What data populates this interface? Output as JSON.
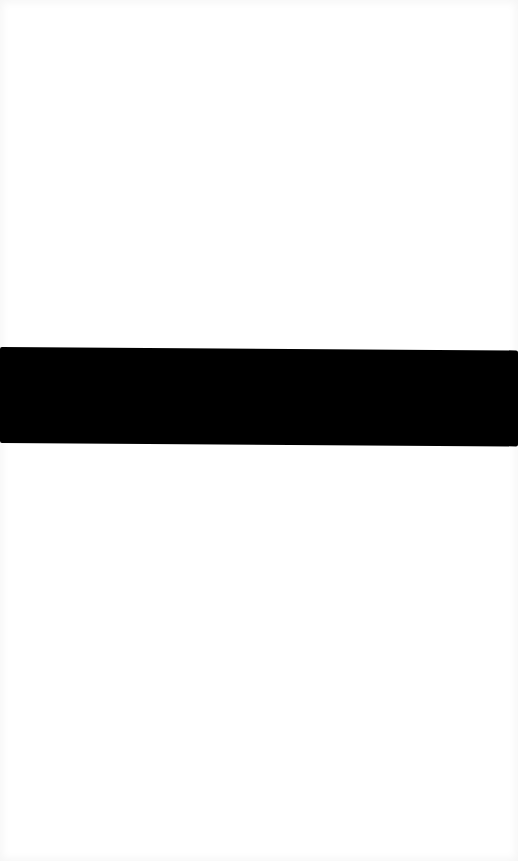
{
  "screen": {
    "width": 518,
    "height": 861,
    "background_color": "#ffffff",
    "edge_shade_color": "#f5f5f5"
  },
  "black_band": {
    "color": "#000000",
    "top_left_y": 347,
    "bottom_left_y": 441,
    "top_right_y": 350,
    "bottom_right_y": 445
  },
  "text_content": []
}
